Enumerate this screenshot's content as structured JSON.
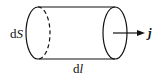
{
  "diagram": {
    "labels": {
      "area": {
        "prefix": "d",
        "var": "S"
      },
      "length": {
        "prefix": "d",
        "var": "l"
      },
      "current_density": "j"
    },
    "colors": {
      "stroke": "#111111",
      "background": "#ffffff"
    }
  }
}
